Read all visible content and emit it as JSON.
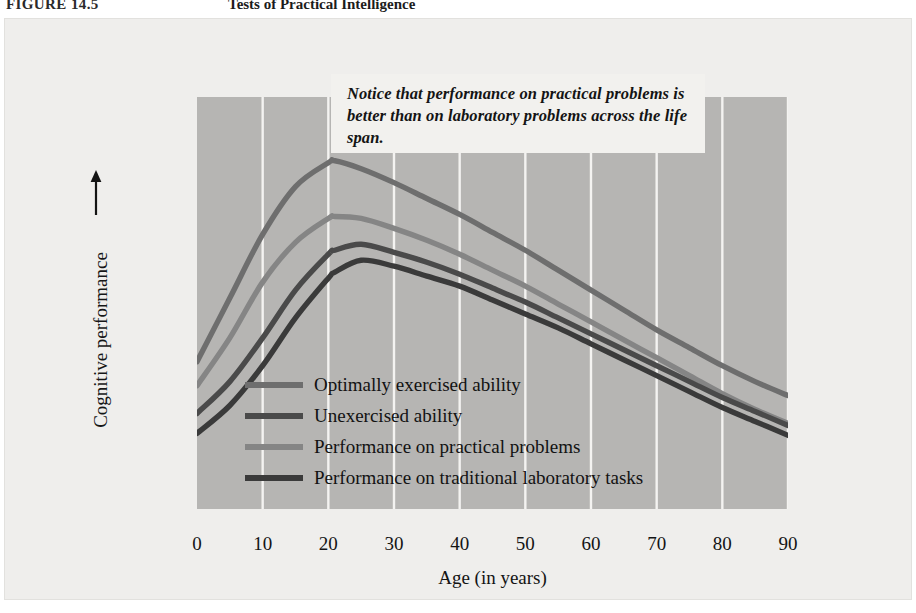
{
  "header": {
    "figure_number": "FIGURE 14.5",
    "figure_title": "Tests of Practical Intelligence"
  },
  "callout": {
    "text": "Notice that performance on practical problems is better than on laboratory problems across the life span."
  },
  "axes": {
    "y_label": "Cognitive performance",
    "y_arrow_icon": "up-arrow-icon",
    "x_label": "Age (in years)",
    "x_ticks": [
      "0",
      "10",
      "20",
      "30",
      "40",
      "50",
      "60",
      "70",
      "80",
      "90"
    ]
  },
  "legend": {
    "items": [
      {
        "label": "Optimally exercised ability",
        "color": "#6e6e6e"
      },
      {
        "label": "Unexercised ability",
        "color": "#4a4a4a"
      },
      {
        "label": "Performance on practical problems",
        "color": "#858585"
      },
      {
        "label": "Performance on traditional laboratory tasks",
        "color": "#3a3a3a"
      }
    ]
  },
  "colors": {
    "page_background": "#ffffff",
    "panel_background": "#efeeec",
    "plot_background": "#b6b5b3",
    "gridline": "#f4f3f1",
    "callout_background": "#f2f1ee",
    "text": "#141414"
  },
  "chart_data": {
    "type": "line",
    "title": "Tests of Practical Intelligence",
    "xlabel": "Age (in years)",
    "ylabel": "Cognitive performance",
    "xlim": [
      0,
      90
    ],
    "ylim": [
      0,
      100
    ],
    "grid": "vertical-only",
    "y_axis_ticks_shown": false,
    "legend_position": "inside-lower-left",
    "annotation": "Notice that performance on practical problems is better than on laboratory problems across the life span.",
    "x": [
      0,
      5,
      10,
      15,
      20,
      21,
      25,
      30,
      35,
      40,
      45,
      50,
      55,
      60,
      65,
      70,
      75,
      80,
      85,
      90
    ],
    "series": [
      {
        "name": "Optimally exercised ability",
        "color": "#6e6e6e",
        "values": [
          36,
          52,
          68,
          80,
          86,
          86.5,
          84.5,
          81,
          77,
          73,
          68.5,
          64,
          59,
          54,
          49,
          44,
          39.5,
          35,
          31,
          27.5
        ]
      },
      {
        "name": "Performance on practical problems",
        "color": "#858585",
        "values": [
          30,
          42,
          56,
          66,
          72,
          72.5,
          72,
          69.5,
          66.5,
          63,
          59,
          55,
          50.5,
          46,
          41.5,
          37,
          32.5,
          28,
          24,
          20.5
        ]
      },
      {
        "name": "Unexercised ability",
        "color": "#4a4a4a",
        "values": [
          23,
          31,
          42,
          54,
          63,
          64,
          65.5,
          63.5,
          61,
          58,
          54.5,
          51,
          47,
          43,
          39,
          35,
          31,
          27,
          23.5,
          20
        ]
      },
      {
        "name": "Performance on traditional laboratory tasks",
        "color": "#3a3a3a",
        "values": [
          18,
          25,
          35,
          47,
          57,
          58.5,
          61.5,
          60,
          57.5,
          55,
          51.5,
          48,
          44.5,
          40.5,
          36.5,
          32.5,
          28.5,
          24.5,
          21,
          17.5
        ]
      }
    ]
  }
}
